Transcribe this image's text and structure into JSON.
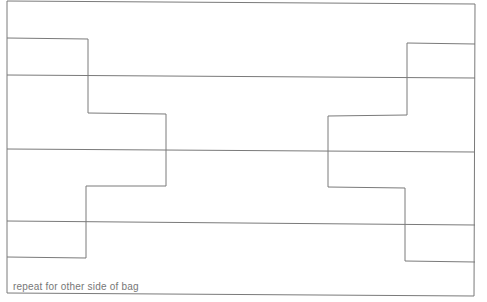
{
  "diagram": {
    "caption": "repeat for other side of bag",
    "line_color": "#7a7a7a",
    "outer_rect": {
      "x1": 7,
      "y1": 1,
      "x2": 475,
      "y2": 296
    },
    "horizontal_lines": [
      75,
      150,
      223
    ],
    "left_step_path": "7,38 88,38 88,113 166,113 166,186 86,186 86,258 7,258",
    "right_step_path": "475,43 407,43 407,115 328,115 328,187 405,187 405,260 475,260"
  }
}
